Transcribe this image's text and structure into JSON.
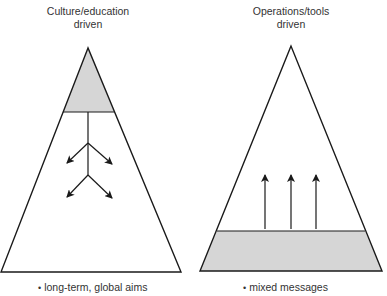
{
  "diagram": {
    "left": {
      "title_line1": "Culture/education",
      "title_line2": "driven",
      "caption": "long-term, global aims",
      "bullet": "•",
      "shaded_region": "top",
      "arrow_direction": "down-branching"
    },
    "right": {
      "title_line1": "Operations/tools",
      "title_line2": "driven",
      "caption": "mixed messages",
      "bullet": "•",
      "shaded_region": "bottom",
      "arrow_direction": "up",
      "arrow_count": 3
    },
    "colors": {
      "stroke": "#1a1a1a",
      "shade": "#d6d6d6",
      "text": "#333333"
    }
  }
}
